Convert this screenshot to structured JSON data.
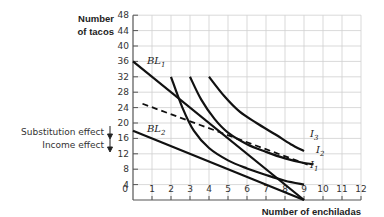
{
  "chart_data": {
    "type": "line",
    "title": "",
    "xlabel": "Number of enchiladas",
    "ylabel": "Number of tacos",
    "xlim": [
      0,
      12
    ],
    "ylim": [
      0,
      48
    ],
    "x_ticks": [
      "0",
      "1",
      "2",
      "3",
      "4",
      "5",
      "6",
      "7",
      "8",
      "9",
      "10",
      "11",
      "12"
    ],
    "y_ticks": [
      "4",
      "8",
      "12",
      "16",
      "20",
      "24",
      "28",
      "32",
      "36",
      "40",
      "44",
      "48"
    ],
    "grid": true,
    "series": [
      {
        "name": "BL1",
        "style": "solid",
        "points": [
          [
            0,
            36
          ],
          [
            9,
            0
          ]
        ]
      },
      {
        "name": "BL2",
        "style": "solid",
        "points": [
          [
            0,
            18
          ],
          [
            9,
            0
          ]
        ]
      },
      {
        "name": "Compensated budget line",
        "style": "dashed",
        "points": [
          [
            0.5,
            25
          ],
          [
            9.3,
            9
          ]
        ]
      },
      {
        "name": "I1",
        "style": "solid",
        "points": [
          [
            2,
            32
          ],
          [
            2.6,
            24
          ],
          [
            3.2,
            18
          ],
          [
            4,
            13.5
          ],
          [
            5,
            10.3
          ],
          [
            6,
            8.2
          ],
          [
            7,
            6.5
          ],
          [
            8,
            5
          ],
          [
            9,
            4
          ]
        ]
      },
      {
        "name": "I2",
        "style": "solid",
        "points": [
          [
            3,
            32
          ],
          [
            3.6,
            26
          ],
          [
            4.3,
            21
          ],
          [
            5,
            17.5
          ],
          [
            6,
            14.5
          ],
          [
            7,
            12.5
          ],
          [
            8,
            10.8
          ],
          [
            9,
            9.6
          ],
          [
            9.5,
            9.3
          ]
        ]
      },
      {
        "name": "I3",
        "style": "solid",
        "points": [
          [
            4,
            32
          ],
          [
            4.8,
            27
          ],
          [
            5.6,
            23
          ],
          [
            6.5,
            20
          ],
          [
            7.5,
            17
          ],
          [
            8.3,
            14.5
          ],
          [
            9,
            12.7
          ]
        ]
      }
    ],
    "curve_labels": [
      {
        "text": "BL",
        "sub": "1",
        "x": 0.7,
        "y": 34
      },
      {
        "text": "BL",
        "sub": "2",
        "x": 0.7,
        "y": 19
      },
      {
        "text": "I",
        "sub": "3",
        "x": 9.3,
        "y": 13
      },
      {
        "text": "I",
        "sub": "2",
        "x": 9.8,
        "y": 9
      },
      {
        "text": "I",
        "sub": "1",
        "x": 9.3,
        "y": 4
      }
    ],
    "annotations": [
      {
        "text": "Substitution effect",
        "arrow": "down"
      },
      {
        "text": "Income effect",
        "arrow": "down"
      }
    ]
  },
  "labels": {
    "ylabel_line1": "Number",
    "ylabel_line2": "of tacos",
    "xlabel": "Number of enchiladas",
    "substitution": "Substitution effect",
    "income": "Income effect",
    "bl1": "BL",
    "bl1_sub": "1",
    "bl2": "BL",
    "bl2_sub": "2",
    "i1": "I",
    "i1_sub": "1",
    "i2": "I",
    "i2_sub": "2",
    "i3": "I",
    "i3_sub": "3",
    "origin": "0"
  }
}
